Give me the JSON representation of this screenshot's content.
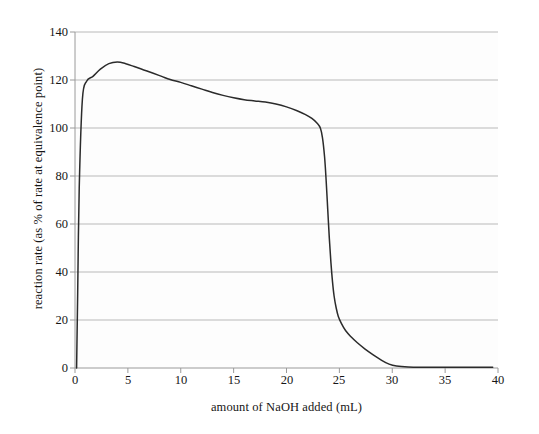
{
  "chart_data": {
    "type": "line",
    "title": "",
    "xlabel": "amount of NaOH added (mL)",
    "ylabel": "reaction rate (as % of rate at equivalence point)",
    "xlim": [
      0,
      40
    ],
    "ylim": [
      0,
      140
    ],
    "xticks": [
      "0",
      "5",
      "10",
      "15",
      "20",
      "25",
      "30",
      "35",
      "40"
    ],
    "yticks": [
      "0",
      "20",
      "40",
      "60",
      "80",
      "100",
      "120",
      "140"
    ],
    "grid": "horizontal",
    "legend": "none",
    "series": [
      {
        "name": "reaction rate",
        "color": "#2b2b2b",
        "x": [
          0.15,
          0.25,
          0.4,
          0.7,
          1.1,
          1.7,
          2.4,
          3.2,
          4.0,
          4.8,
          5.6,
          6.5,
          7.4,
          8.2,
          9.0,
          10.0,
          11.0,
          12.0,
          13.0,
          14.0,
          15.0,
          16.0,
          17.0,
          18.0,
          19.0,
          20.0,
          21.0,
          21.8,
          22.4,
          22.9,
          23.2,
          23.4,
          23.6,
          23.75,
          23.9,
          24.05,
          24.2,
          24.35,
          24.5,
          24.7,
          24.9,
          25.2,
          25.6,
          26.1,
          26.7,
          27.4,
          28.2,
          29.0,
          29.7,
          30.4,
          31.5,
          33.0,
          35.0,
          37.0,
          39.5
        ],
        "y": [
          0,
          30,
          75,
          112,
          119.5,
          121.5,
          124.5,
          126.8,
          127.5,
          126.8,
          125.6,
          124.2,
          122.8,
          121.5,
          120.2,
          119.0,
          117.6,
          116.2,
          114.8,
          113.6,
          112.6,
          111.8,
          111.3,
          110.8,
          110.0,
          108.8,
          107.2,
          105.6,
          104.0,
          102.0,
          100.0,
          96.0,
          88.0,
          78.0,
          66.0,
          54.0,
          44.0,
          36.0,
          30.0,
          25.0,
          21.5,
          18.5,
          15.5,
          13.0,
          10.5,
          8.0,
          5.5,
          3.2,
          1.6,
          0.8,
          0.4,
          0.3,
          0.3,
          0.3,
          0.3
        ]
      }
    ]
  },
  "axes": {
    "background_color": "#fdfdfd",
    "gridline_color": "#b9b9b9",
    "axis_color": "#9a9a9a",
    "curve_color": "#2b2b2b"
  }
}
